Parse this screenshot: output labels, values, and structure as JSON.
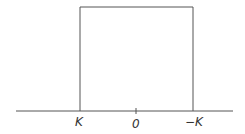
{
  "diagram": {
    "labels": {
      "left": "K",
      "center": "0",
      "right": "−K"
    },
    "stroke_color": "#555555"
  }
}
